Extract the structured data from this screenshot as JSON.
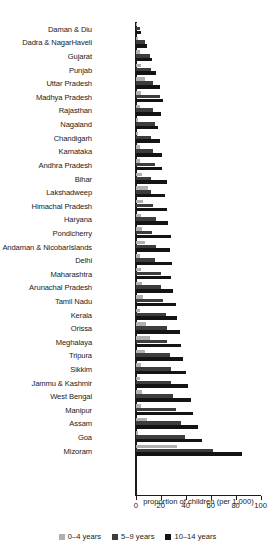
{
  "chart_data": {
    "type": "bar",
    "orientation": "horizontal",
    "title": "",
    "subtitle": "",
    "xlabel": "proportion of children (per 1,000)",
    "ylabel": "",
    "xlim": [
      0,
      100
    ],
    "xticks": [
      0,
      20,
      40,
      60,
      80,
      100
    ],
    "xtick_labels": [
      "0",
      "20",
      "40",
      "60",
      "80",
      "100"
    ],
    "grid": false,
    "legend_position": "bottom",
    "categories": [
      "Daman & Diu",
      "Dadra & NagarHaveli",
      "Gujarat",
      "Punjab",
      "Uttar Pradesh",
      "Madhya Pradesh",
      "Rajasthan",
      "Nagaland",
      "Chandigarh",
      "Kamataka",
      "Andhra Pradesh",
      "Bihar",
      "Lakshadweep",
      "Himachal Pradesh",
      "Haryana",
      "Pondicherry",
      "Andaman & NicobarIslands",
      "Delhi",
      "Maharashtra",
      "Arunachal Pradesh",
      "Tamil Nadu",
      "Kerala",
      "Orissa",
      "Meghalaya",
      "Tripura",
      "Sikkim",
      "Jammu & Kashmir",
      "West Bengal",
      "Manipur",
      "Assam",
      "Goa",
      "Mizoram"
    ],
    "series": [
      {
        "name": "0–4 years",
        "color": "#b0b0b0",
        "values": [
          1,
          2,
          3,
          4,
          7,
          4,
          3,
          2,
          2,
          3,
          3,
          5,
          10,
          6,
          4,
          5,
          7,
          3,
          4,
          5,
          6,
          3,
          8,
          11,
          7,
          4,
          3,
          5,
          4,
          9,
          2,
          33
        ]
      },
      {
        "name": "5–9 years",
        "color": "#3d3d3d",
        "values": [
          3,
          7,
          11,
          12,
          14,
          19,
          14,
          15,
          12,
          14,
          15,
          12,
          12,
          14,
          16,
          13,
          16,
          15,
          20,
          20,
          22,
          24,
          25,
          25,
          27,
          28,
          28,
          30,
          32,
          36,
          39,
          62
        ]
      },
      {
        "name": "10–14 years",
        "color": "#141414",
        "values": [
          4,
          9,
          13,
          16,
          19,
          22,
          20,
          18,
          19,
          21,
          21,
          25,
          23,
          25,
          26,
          28,
          27,
          29,
          28,
          30,
          32,
          33,
          35,
          36,
          38,
          40,
          42,
          44,
          46,
          50,
          53,
          85
        ]
      }
    ],
    "legend": [
      {
        "label": "0–4 years",
        "color": "#b0b0b0"
      },
      {
        "label": "5–9 years",
        "color": "#3d3d3d"
      },
      {
        "label": "10–14 years",
        "color": "#141414"
      }
    ]
  }
}
